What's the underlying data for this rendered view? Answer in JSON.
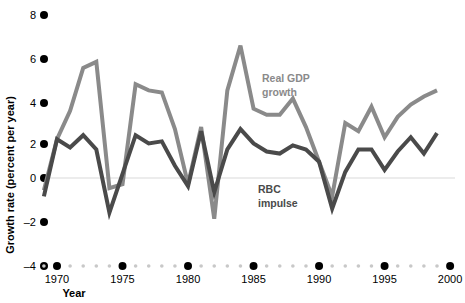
{
  "chart_data": {
    "type": "line",
    "title": "",
    "xlabel": "Year",
    "ylabel": "Growth rate (percent per year)",
    "xlim": [
      1969,
      2000
    ],
    "ylim": [
      -4,
      8
    ],
    "yticks": [
      -4,
      -2,
      0,
      2,
      4,
      6,
      8
    ],
    "ytick_labels": [
      "–4",
      "–2",
      "0",
      "2",
      "4",
      "6",
      "8"
    ],
    "xticks": [
      1970,
      1975,
      1980,
      1985,
      1990,
      1995,
      2000
    ],
    "xtick_labels": [
      "1970",
      "1975",
      "1980",
      "1985",
      "1990",
      "1995",
      "2000"
    ],
    "grid": false,
    "zero_line": true,
    "legend_position": "inline-annotations",
    "x": [
      1969,
      1970,
      1971,
      1972,
      1973,
      1974,
      1975,
      1976,
      1977,
      1978,
      1979,
      1980,
      1981,
      1982,
      1983,
      1984,
      1985,
      1986,
      1987,
      1988,
      1989,
      1990,
      1991,
      1992,
      1993,
      1994,
      1995,
      1996,
      1997,
      1998,
      1999
    ],
    "series": [
      {
        "name": "Real GDP growth",
        "color": "#8a8a8a",
        "label_text_line1": "Real GDP",
        "label_text_line2": "growth",
        "values": [
          -0.6,
          1.9,
          3.3,
          5.4,
          5.7,
          -0.5,
          -0.3,
          4.6,
          4.3,
          4.2,
          2.4,
          -0.3,
          2.5,
          -2.0,
          4.3,
          6.5,
          3.4,
          3.1,
          3.1,
          3.9,
          2.5,
          0.8,
          -0.9,
          2.7,
          2.3,
          3.5,
          2.0,
          3.0,
          3.6,
          4.0,
          4.3
        ]
      },
      {
        "name": "RBC impulse",
        "color": "#4a4a4a",
        "label_text_line1": "RBC",
        "label_text_line2": "impulse",
        "values": [
          -0.9,
          1.9,
          1.5,
          2.1,
          1.4,
          -1.7,
          0.2,
          2.1,
          1.7,
          1.8,
          0.6,
          -0.4,
          2.3,
          -0.7,
          1.4,
          2.4,
          1.7,
          1.3,
          1.2,
          1.6,
          1.4,
          0.8,
          -1.5,
          0.3,
          1.4,
          1.4,
          0.4,
          1.3,
          2.0,
          1.2,
          2.2
        ]
      }
    ],
    "annotations": [
      {
        "id": "gdp-annotation",
        "text_line1": "Real GDP",
        "text_line2": "growth",
        "x": 262,
        "y": 82
      },
      {
        "id": "rbc-annotation",
        "text_line1": "RBC",
        "text_line2": "impulse",
        "x": 258,
        "y": 193
      }
    ]
  },
  "axis": {
    "y_title": "Growth rate (percent per year)",
    "x_title": "Year"
  }
}
